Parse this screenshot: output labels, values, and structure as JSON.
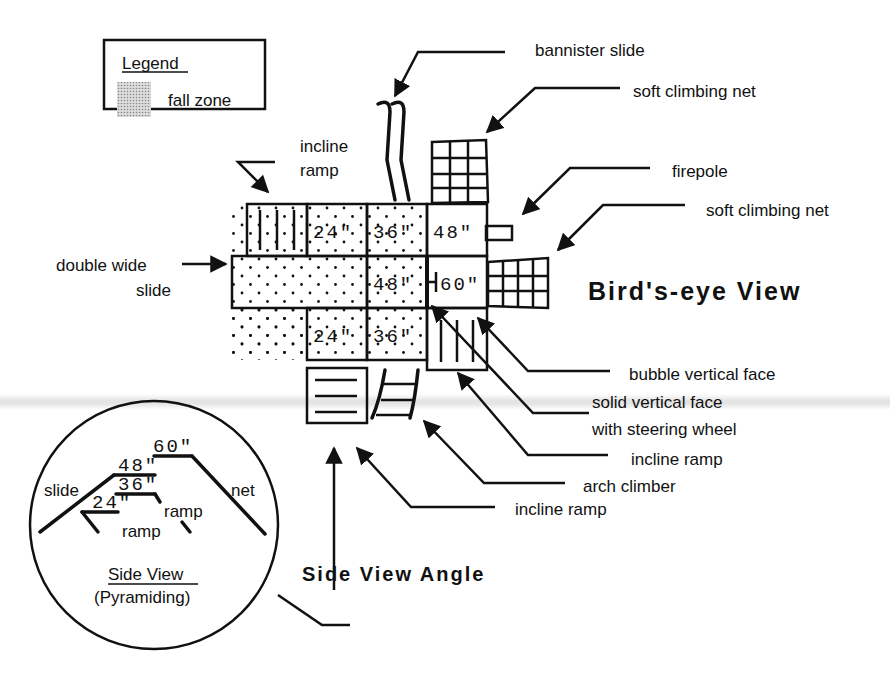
{
  "legend": {
    "title": "Legend",
    "items": [
      {
        "swatch": "dotted-gray",
        "label": "fall zone"
      }
    ]
  },
  "birds_eye": {
    "title": "Bird's-eye View",
    "platform_heights": {
      "top_row": [
        "24\"",
        "36\"",
        "48\""
      ],
      "middle_row": [
        "48\"",
        "60\""
      ],
      "bottom_row": [
        "24\"",
        "36\""
      ]
    },
    "callouts": {
      "incline_ramp_top": "incline\nramp",
      "bannister_slide": "bannister slide",
      "soft_climbing_net_top": "soft climbing net",
      "firepole": "firepole",
      "soft_climbing_net_right": "soft climbing net",
      "double_wide_slide": "double wide\nslide",
      "bubble_vertical_face": "bubble vertical face",
      "solid_vertical_face": "solid vertical face",
      "solid_vertical_face_2": "with steering wheel",
      "incline_ramp_right": "incline ramp",
      "arch_climber": "arch climber",
      "incline_ramp_bottom": "incline ramp"
    }
  },
  "side_view": {
    "title": "Side View",
    "subtitle": "(Pyramiding)",
    "heights": [
      "60\"",
      "48\"",
      "36\"",
      "24\""
    ],
    "labels": {
      "slide": "slide",
      "net": "net",
      "ramp_upper": "ramp",
      "ramp_lower": "ramp"
    },
    "angle_label": "Side View Angle"
  }
}
